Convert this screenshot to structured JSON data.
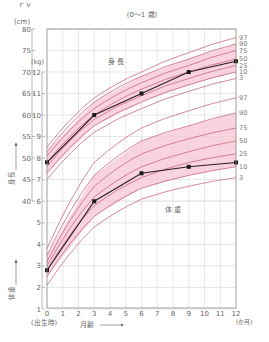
{
  "chart_data": {
    "type": "line",
    "title": "(0〜1 歳)",
    "top_fragment": "ｒｖ",
    "xlabel": "月齢",
    "x_unit": "(か月)",
    "x_zero_note": "(出生時)",
    "x": [
      0,
      1,
      2,
      3,
      4,
      5,
      6,
      7,
      8,
      9,
      10,
      11,
      12
    ],
    "x_ticks": [
      "0",
      "1",
      "2",
      "3",
      "4",
      "5",
      "6",
      "7",
      "8",
      "9",
      "10",
      "11",
      "12"
    ],
    "height_axis": {
      "label": "身長",
      "unit": "(cm)",
      "ticks": [
        40,
        45,
        50,
        55,
        60,
        65,
        70,
        75,
        80
      ],
      "range": [
        40,
        80
      ]
    },
    "weight_axis": {
      "label": "体重",
      "unit": "(kg)",
      "ticks": [
        1,
        2,
        3,
        4,
        5,
        6,
        7,
        8,
        9,
        10,
        11,
        12
      ],
      "range": [
        1,
        12
      ]
    },
    "percentile_labels": [
      "97",
      "90",
      "75",
      "50",
      "25",
      "10",
      "3"
    ],
    "grid": true,
    "band_color": "#f7c6d3",
    "curve_color": "#c0577a",
    "series": [
      {
        "name": "身 長",
        "unit": "cm",
        "x": [
          0,
          3,
          6,
          9,
          12
        ],
        "values": [
          49,
          60,
          65,
          70,
          72.5
        ]
      },
      {
        "name": "体 重",
        "unit": "kg",
        "x": [
          0,
          3,
          6,
          9,
          12
        ],
        "values": [
          2.8,
          6.0,
          7.3,
          7.6,
          7.8
        ]
      }
    ],
    "height_percentiles": {
      "97": [
        52.5,
        64,
        70,
        74.5,
        78
      ],
      "90": [
        51.5,
        63,
        69,
        73,
        76.5
      ],
      "75": [
        50.5,
        61.5,
        67.5,
        71.5,
        75
      ],
      "50": [
        49,
        60,
        66,
        70,
        73
      ],
      "25": [
        48,
        59,
        64.5,
        68.5,
        71.5
      ],
      "10": [
        46.5,
        57.5,
        63,
        67,
        70
      ],
      "3": [
        45,
        56,
        61.5,
        65.5,
        68.5
      ]
    },
    "weight_percentiles": {
      "97": [
        3.8,
        7.8,
        9.4,
        10.2,
        10.8
      ],
      "90": [
        3.5,
        7.2,
        8.8,
        9.5,
        10.1
      ],
      "75": [
        3.2,
        6.7,
        8.2,
        8.9,
        9.4
      ],
      "50": [
        3.0,
        6.2,
        7.6,
        8.3,
        8.8
      ],
      "25": [
        2.8,
        5.8,
        7.1,
        7.8,
        8.2
      ],
      "10": [
        2.5,
        5.3,
        6.6,
        7.2,
        7.6
      ],
      "3": [
        2.1,
        4.8,
        6.1,
        6.7,
        7.1
      ]
    }
  }
}
